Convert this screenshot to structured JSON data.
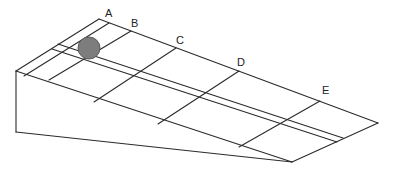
{
  "diagram": {
    "markers": [
      {
        "label": "A",
        "x": 106,
        "y": 14
      },
      {
        "label": "B",
        "x": 131,
        "y": 25
      },
      {
        "label": "C",
        "x": 176,
        "y": 42
      },
      {
        "label": "D",
        "x": 237,
        "y": 63
      },
      {
        "label": "E",
        "x": 322,
        "y": 91
      }
    ],
    "ball": {
      "cx": 89,
      "cy": 48,
      "r": 11,
      "fill": "#7d7d7d",
      "stroke": "#5a5a5a"
    },
    "colors": {
      "line": "#2b2b2b",
      "background": "#ffffff"
    }
  }
}
